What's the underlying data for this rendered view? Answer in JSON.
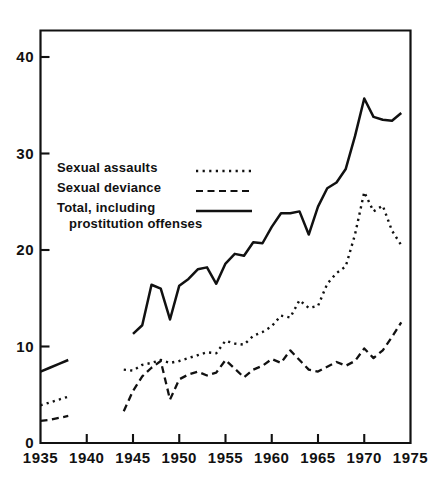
{
  "chart_data": {
    "type": "line",
    "title": "",
    "xlabel": "",
    "ylabel": "",
    "xlim": [
      1935,
      1975
    ],
    "ylim": [
      0,
      44.5
    ],
    "xticks": [
      1935,
      1940,
      1945,
      1950,
      1955,
      1960,
      1965,
      1970,
      1975
    ],
    "yticks": [
      0,
      10,
      20,
      30,
      40
    ],
    "grid": false,
    "legend_position": "upper-left-inside",
    "series": [
      {
        "name": "Sexual assaults",
        "style": "dotted",
        "color": "#111111",
        "segments": [
          {
            "x": [
              1935,
              1936,
              1937,
              1938
            ],
            "y": [
              3.9,
              4.2,
              4.5,
              4.8
            ]
          },
          {
            "x": [
              1944,
              1945,
              1946,
              1947,
              1948,
              1949,
              1950,
              1951,
              1952,
              1953,
              1954,
              1955,
              1956,
              1957,
              1958,
              1959,
              1960,
              1961,
              1962,
              1963,
              1964,
              1965,
              1966,
              1967,
              1968,
              1969,
              1970,
              1971,
              1972,
              1973,
              1974
            ],
            "y": [
              7.6,
              7.5,
              8.1,
              8.3,
              8.6,
              8.3,
              8.5,
              8.8,
              9.1,
              9.4,
              9.3,
              10.6,
              10.3,
              10.2,
              11.1,
              11.5,
              12.1,
              13.2,
              13.0,
              14.8,
              14.0,
              14.2,
              16.5,
              17.6,
              18.3,
              21.6,
              26.0,
              24.0,
              24.6,
              22.0,
              20.5
            ]
          }
        ]
      },
      {
        "name": "Sexual deviance",
        "style": "dashed",
        "color": "#111111",
        "segments": [
          {
            "x": [
              1935,
              1936,
              1937,
              1938
            ],
            "y": [
              2.3,
              2.4,
              2.6,
              2.8
            ]
          },
          {
            "x": [
              1944,
              1945,
              1946,
              1947,
              1948,
              1949,
              1950,
              1951,
              1952,
              1953,
              1954,
              1955,
              1956,
              1957,
              1958,
              1959,
              1960,
              1961,
              1962,
              1963,
              1964,
              1965,
              1966,
              1967,
              1968,
              1969,
              1970,
              1971,
              1972,
              1973,
              1974
            ],
            "y": [
              3.3,
              5.4,
              6.9,
              7.8,
              8.5,
              4.5,
              6.6,
              7.1,
              7.4,
              7.0,
              7.3,
              8.6,
              7.7,
              6.8,
              7.6,
              8.0,
              8.7,
              8.3,
              9.6,
              8.6,
              7.6,
              7.4,
              7.9,
              8.4,
              8.0,
              8.5,
              9.8,
              8.8,
              9.6,
              11.0,
              12.5
            ]
          }
        ]
      },
      {
        "name": "Total, including prostitution offenses",
        "style": "solid",
        "color": "#111111",
        "segments": [
          {
            "x": [
              1935,
              1936,
              1937,
              1938
            ],
            "y": [
              7.4,
              7.8,
              8.2,
              8.6
            ]
          },
          {
            "x": [
              1945,
              1946,
              1947,
              1948,
              1949,
              1950,
              1951,
              1952,
              1953,
              1954,
              1955,
              1956,
              1957,
              1958,
              1959,
              1960,
              1961,
              1962,
              1963,
              1964,
              1965,
              1966,
              1967,
              1968,
              1969,
              1970,
              1971,
              1972,
              1973,
              1974
            ],
            "y": [
              11.3,
              12.2,
              16.4,
              16.0,
              12.8,
              16.3,
              17.0,
              18.0,
              18.2,
              16.5,
              18.6,
              19.6,
              19.4,
              20.8,
              20.7,
              22.4,
              23.8,
              23.8,
              24.0,
              21.6,
              24.5,
              26.4,
              27.0,
              28.4,
              31.8,
              35.7,
              33.8,
              33.5,
              33.4,
              34.2
            ]
          }
        ]
      }
    ]
  },
  "axis": {
    "y_tick_labels": [
      "40",
      "30",
      "20",
      "10",
      "0"
    ],
    "x_tick_labels": [
      "1935",
      "1940",
      "1945",
      "1950",
      "1955",
      "1960",
      "1965",
      "1970",
      "1975"
    ]
  },
  "legend": {
    "entries": [
      {
        "label": "Sexual assaults",
        "label2": "",
        "style": "dotted"
      },
      {
        "label": "Sexual deviance",
        "label2": "",
        "style": "dashed"
      },
      {
        "label": "Total, including",
        "label2": "prostitution offenses",
        "style": "solid"
      }
    ]
  },
  "colors": {
    "ink": "#111111",
    "background": "#ffffff"
  }
}
